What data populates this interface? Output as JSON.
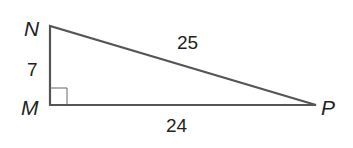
{
  "diagram": {
    "type": "right-triangle",
    "vertices": {
      "N": {
        "label": "N"
      },
      "M": {
        "label": "M",
        "right_angle": true
      },
      "P": {
        "label": "P"
      }
    },
    "sides": {
      "NM": {
        "label": "7"
      },
      "NP": {
        "label": "25"
      },
      "MP": {
        "label": "24"
      }
    },
    "colors": {
      "stroke": "#555555",
      "text": "#231f20"
    }
  }
}
